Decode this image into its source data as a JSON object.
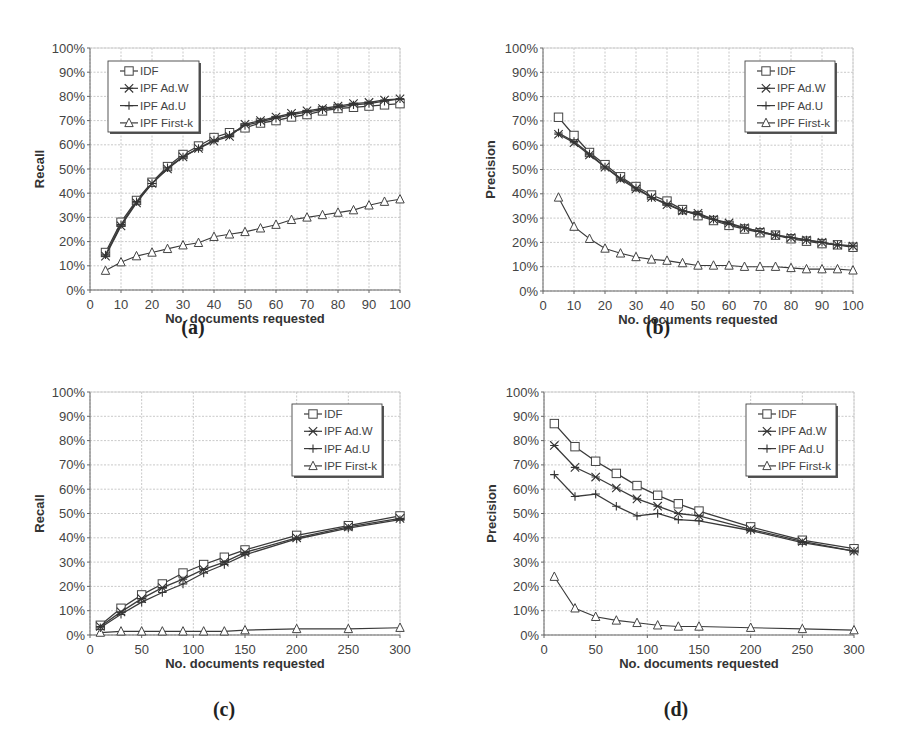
{
  "figure": {
    "captions": [
      "(a)",
      "(b)",
      "(c)",
      "(d)"
    ]
  },
  "legend": [
    "IDF",
    "IPF Ad.W",
    "IPF Ad.U",
    "IPF First-k"
  ],
  "chart_data": [
    {
      "id": "a",
      "type": "line",
      "title": "",
      "caption": "(a)",
      "xlabel": "No. documents requested",
      "ylabel": "Recall",
      "xlim": [
        0,
        100
      ],
      "ylim": [
        0,
        100
      ],
      "xticks": [
        0,
        10,
        20,
        30,
        40,
        50,
        60,
        70,
        80,
        90,
        100
      ],
      "yticks": [
        "0%",
        "10%",
        "20%",
        "30%",
        "40%",
        "50%",
        "60%",
        "70%",
        "80%",
        "90%",
        "100%"
      ],
      "grid": true,
      "legend_position": "upper-left",
      "x": [
        5,
        10,
        15,
        20,
        25,
        30,
        35,
        40,
        45,
        50,
        55,
        60,
        65,
        70,
        75,
        80,
        85,
        90,
        95,
        100
      ],
      "series": [
        {
          "name": "IDF",
          "marker": "square",
          "values": [
            15.5,
            28,
            37,
            44.5,
            51,
            56,
            59.5,
            63,
            65,
            67,
            69,
            70,
            71.5,
            72.5,
            74,
            75,
            75.5,
            76,
            76.5,
            77
          ]
        },
        {
          "name": "IPF Ad.W",
          "marker": "x",
          "values": [
            14,
            26.5,
            36,
            44,
            50,
            55,
            58.5,
            61.5,
            63.5,
            68.5,
            70,
            71.5,
            73,
            74,
            75,
            76,
            77,
            77.5,
            78.5,
            79
          ]
        },
        {
          "name": "IPF Ad.U",
          "marker": "plus",
          "values": [
            14.5,
            27,
            36.5,
            44,
            50.5,
            55,
            58.5,
            62,
            64,
            68,
            69.5,
            71,
            72.5,
            73.5,
            74.5,
            75.5,
            76.5,
            77,
            78,
            79
          ]
        },
        {
          "name": "IPF First-k",
          "marker": "triangle",
          "values": [
            8,
            11.5,
            14,
            15.5,
            17,
            18.5,
            19.5,
            22,
            23,
            24,
            25.5,
            27,
            29,
            30,
            31,
            32,
            33,
            35,
            36.5,
            37.5
          ]
        }
      ]
    },
    {
      "id": "b",
      "type": "line",
      "title": "",
      "caption": "(b)",
      "xlabel": "No. documents requested",
      "ylabel": "Precision",
      "xlim": [
        0,
        100
      ],
      "ylim": [
        0,
        100
      ],
      "xticks": [
        0,
        10,
        20,
        30,
        40,
        50,
        60,
        70,
        80,
        90,
        100
      ],
      "yticks": [
        "0%",
        "10%",
        "20%",
        "30%",
        "40%",
        "50%",
        "60%",
        "70%",
        "80%",
        "90%",
        "100%"
      ],
      "grid": true,
      "legend_position": "upper-right",
      "x": [
        5,
        10,
        15,
        20,
        25,
        30,
        35,
        40,
        45,
        50,
        55,
        60,
        65,
        70,
        75,
        80,
        85,
        90,
        95,
        100
      ],
      "series": [
        {
          "name": "IDF",
          "marker": "square",
          "values": [
            71.5,
            64,
            57,
            52,
            47,
            43,
            39.5,
            37,
            33.5,
            31,
            29,
            27,
            25.5,
            24,
            23,
            21.5,
            20.5,
            19.5,
            19,
            18
          ]
        },
        {
          "name": "IPF Ad.W",
          "marker": "x",
          "values": [
            64.5,
            61,
            56,
            51,
            46,
            42,
            38.5,
            35.5,
            33,
            32,
            29.5,
            28,
            26,
            24.5,
            23,
            22,
            21,
            20,
            19,
            18.5
          ]
        },
        {
          "name": "IPF Ad.U",
          "marker": "plus",
          "values": [
            65,
            61.5,
            56.5,
            51,
            46.5,
            42.5,
            38.5,
            36,
            33,
            31.5,
            29.5,
            27.5,
            26,
            24.5,
            23,
            22,
            21,
            20,
            19,
            18.5
          ]
        },
        {
          "name": "IPF First-k",
          "marker": "triangle",
          "values": [
            38.5,
            26.5,
            21.5,
            17.5,
            15.5,
            14,
            13,
            12.5,
            11.5,
            10.5,
            10.5,
            10.5,
            10,
            10,
            10,
            9.5,
            9,
            9,
            9,
            8.5
          ]
        }
      ]
    },
    {
      "id": "c",
      "type": "line",
      "title": "",
      "caption": "(c)",
      "xlabel": "No. documents requested",
      "ylabel": "Recall",
      "xlim": [
        0,
        300
      ],
      "ylim": [
        0,
        100
      ],
      "xticks": [
        0,
        50,
        100,
        150,
        200,
        250,
        300
      ],
      "yticks": [
        "0%",
        "10%",
        "20%",
        "30%",
        "40%",
        "50%",
        "60%",
        "70%",
        "80%",
        "90%",
        "100%"
      ],
      "grid": true,
      "legend_position": "upper-right",
      "x": [
        10,
        30,
        50,
        70,
        90,
        110,
        130,
        150,
        200,
        250,
        300
      ],
      "series": [
        {
          "name": "IDF",
          "marker": "square",
          "values": [
            4,
            11,
            16.5,
            21,
            25.5,
            29,
            32,
            35,
            41,
            45,
            49
          ]
        },
        {
          "name": "IPF Ad.W",
          "marker": "x",
          "values": [
            3.5,
            9.5,
            15,
            19.5,
            23,
            27,
            30,
            34,
            40,
            44.5,
            48
          ]
        },
        {
          "name": "IPF Ad.U",
          "marker": "plus",
          "values": [
            3,
            8.5,
            13.5,
            17.5,
            21,
            25.5,
            29,
            33,
            39.5,
            44,
            47.5
          ]
        },
        {
          "name": "IPF First-k",
          "marker": "triangle",
          "values": [
            1,
            1.5,
            1.5,
            1.5,
            1.5,
            1.5,
            1.5,
            2,
            2.5,
            2.5,
            3
          ]
        }
      ]
    },
    {
      "id": "d",
      "type": "line",
      "title": "",
      "caption": "(d)",
      "xlabel": "No. documents requested",
      "ylabel": "Precision",
      "xlim": [
        0,
        300
      ],
      "ylim": [
        0,
        100
      ],
      "xticks": [
        0,
        50,
        100,
        150,
        200,
        250,
        300
      ],
      "yticks": [
        "0%",
        "10%",
        "20%",
        "30%",
        "40%",
        "50%",
        "60%",
        "70%",
        "80%",
        "90%",
        "100%"
      ],
      "grid": true,
      "legend_position": "upper-right",
      "x": [
        10,
        30,
        50,
        70,
        90,
        110,
        130,
        150,
        200,
        250,
        300
      ],
      "series": [
        {
          "name": "IDF",
          "marker": "square",
          "values": [
            87,
            77.5,
            71.5,
            66.5,
            61.5,
            57.5,
            54,
            51,
            44.5,
            39,
            35.5
          ]
        },
        {
          "name": "IPF Ad.W",
          "marker": "x",
          "values": [
            78,
            69,
            65,
            60.5,
            56,
            53,
            50,
            49,
            43.5,
            38.5,
            34.5
          ]
        },
        {
          "name": "IPF Ad.U",
          "marker": "plus",
          "values": [
            66,
            57,
            58,
            53,
            49,
            50,
            47.5,
            47,
            43,
            38,
            34.5
          ]
        },
        {
          "name": "IPF First-k",
          "marker": "triangle",
          "values": [
            24,
            11,
            7.5,
            6,
            5,
            4,
            3.5,
            3.5,
            3,
            2.5,
            2
          ]
        }
      ]
    }
  ]
}
